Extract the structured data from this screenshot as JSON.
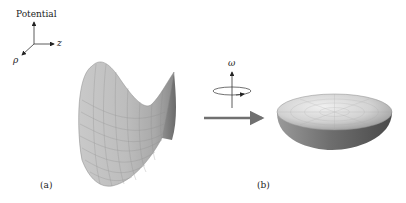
{
  "axes": {
    "vertical_label": "Potential",
    "horizontal_label": "z",
    "diagonal_label": "ρ"
  },
  "rotation": {
    "label": "ω"
  },
  "panels": [
    {
      "label": "(a)",
      "description": "saddle-shaped potential surface"
    },
    {
      "label": "(b)",
      "description": "bowl-shaped (paraboloid) potential surface"
    }
  ],
  "colors": {
    "surface_light": "#d8d8d8",
    "surface_dark": "#6e6e6e",
    "arrow": "#707070",
    "ink": "#222222"
  }
}
